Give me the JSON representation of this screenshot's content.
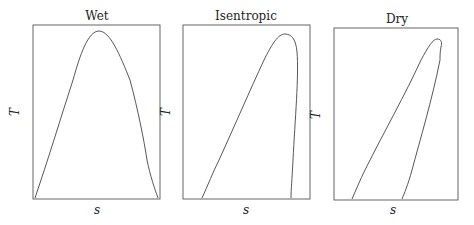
{
  "figure": {
    "panels": [
      {
        "id": "wet",
        "title": "Wet",
        "xlabel": "s",
        "ylabel": "T",
        "frame": {
          "x": 33,
          "y": 25,
          "w": 127,
          "h": 174
        },
        "title_pos": {
          "x": 97,
          "y": 20
        },
        "xlabel_pos": {
          "x": 97,
          "y": 214
        },
        "ylabel_pos": {
          "x": 19,
          "y": 112
        },
        "curve_path": "M35,198 C48,160 60,120 73,80 C80,55 88,31 99,31 C110,31 120,55 130,80 C138,110 144,140 147,160 C150,175 155,190 158,198"
      },
      {
        "id": "isentropic",
        "title": "Isentropic",
        "xlabel": "s",
        "ylabel": "T",
        "frame": {
          "x": 183,
          "y": 25,
          "w": 127,
          "h": 174
        },
        "title_pos": {
          "x": 246,
          "y": 20
        },
        "xlabel_pos": {
          "x": 246,
          "y": 214
        },
        "ylabel_pos": {
          "x": 170,
          "y": 112
        },
        "curve_path": "M202,198 C208,185 213,172 219,160 C235,125 250,90 264,60 C272,44 278,34 285,34 C292,34 296,40 297,52 C299,75 295,120 293,160 C292,180 291,190 291,198"
      },
      {
        "id": "dry",
        "title": "Dry",
        "xlabel": "s",
        "ylabel": "T",
        "frame": {
          "x": 334,
          "y": 28,
          "w": 124,
          "h": 172
        },
        "title_pos": {
          "x": 397,
          "y": 23
        },
        "xlabel_pos": {
          "x": 393,
          "y": 214
        },
        "ylabel_pos": {
          "x": 320,
          "y": 115
        },
        "curve_path": "M352,199 C356,190 360,180 365,170 C385,130 405,95 421,60 C428,47 433,39 437,39 C442,39 442,43 441,47 C440,52 440,56 440,60 C432,100 420,140 412,170 C408,185 404,194 402,199"
      }
    ]
  }
}
